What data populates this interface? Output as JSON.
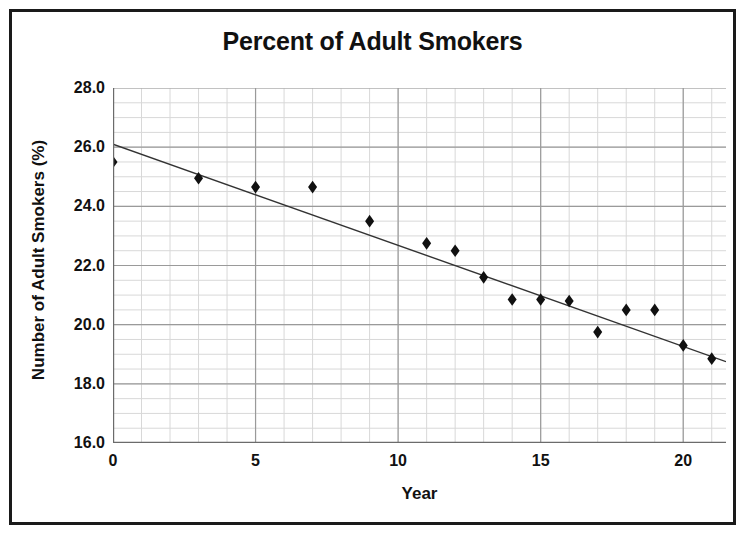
{
  "chart_data": {
    "type": "scatter",
    "title": "Percent of Adult Smokers",
    "xlabel": "Year",
    "ylabel": "Number of Adult Smokers (%)",
    "xlim": [
      0,
      21.5
    ],
    "ylim": [
      16.0,
      28.0
    ],
    "x_ticks": [
      0,
      5,
      10,
      15,
      20
    ],
    "x_tick_labels": [
      "0",
      "5",
      "10",
      "15",
      "20"
    ],
    "x_minor_step": 1,
    "y_ticks": [
      16.0,
      18.0,
      20.0,
      22.0,
      24.0,
      26.0,
      28.0
    ],
    "y_tick_labels": [
      "16.0",
      "18.0",
      "20.0",
      "22.0",
      "24.0",
      "26.0",
      "28.0"
    ],
    "y_minor_step": 0.5,
    "grid": true,
    "grid_color": "#9a9a9a",
    "minor_grid_color": "#d8d8d8",
    "legend": "none",
    "marker": "diamond",
    "marker_color": "#111111",
    "marker_size": 11,
    "series": [
      {
        "name": "Percent of Adult Smokers",
        "x": [
          0,
          3,
          5,
          7,
          9,
          11,
          12,
          13,
          14,
          15,
          16,
          17,
          18,
          19,
          20,
          21
        ],
        "values": [
          25.5,
          24.95,
          24.65,
          24.65,
          23.5,
          22.75,
          22.5,
          21.6,
          20.85,
          20.85,
          20.8,
          19.75,
          20.5,
          20.5,
          19.3,
          18.85
        ]
      }
    ],
    "trendline": {
      "name": "linear trendline",
      "color": "#333333",
      "width": 1.4,
      "x_start": 0,
      "y_start": 26.1,
      "x_end": 21.5,
      "y_end": 18.75
    }
  },
  "figure": {
    "title": "Percent of Adult Smokers",
    "border_color": "#1a1a1a",
    "background": "#ffffff"
  }
}
